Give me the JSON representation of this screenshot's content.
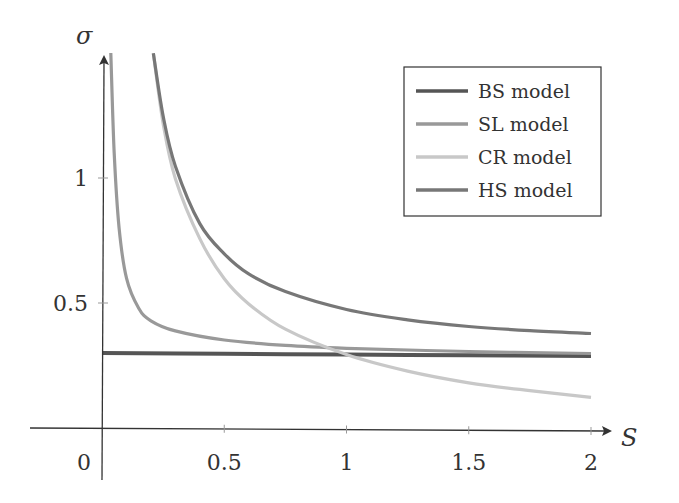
{
  "chart_data": {
    "type": "line",
    "title": "",
    "xlabel": "S",
    "ylabel": "σ",
    "xlim": [
      -0.3,
      2.1
    ],
    "ylim": [
      0,
      1.5
    ],
    "grid": false,
    "legend_position": "upper right",
    "x_ticks": [
      "0",
      "0.5",
      "1",
      "1.5",
      "2"
    ],
    "y_ticks": [
      "0.5",
      "1"
    ],
    "series": [
      {
        "name": "BS model",
        "color": "#555555",
        "x": [
          0.0,
          0.5,
          1.0,
          1.5,
          2.0
        ],
        "y": [
          0.3,
          0.3,
          0.3,
          0.3,
          0.3
        ]
      },
      {
        "name": "SL model",
        "color": "#999999",
        "x": [
          0.036,
          0.05,
          0.07,
          0.1,
          0.15,
          0.2,
          0.3,
          0.5,
          0.75,
          1.0,
          1.5,
          2.0
        ],
        "y": [
          1.5,
          1.1,
          0.8,
          0.6,
          0.48,
          0.43,
          0.39,
          0.355,
          0.335,
          0.325,
          0.315,
          0.31
        ]
      },
      {
        "name": "CR model",
        "color": "#c8c8c8",
        "x": [
          0.21,
          0.25,
          0.3,
          0.4,
          0.5,
          0.6,
          0.75,
          1.0,
          1.25,
          1.5,
          1.75,
          2.0
        ],
        "y": [
          1.5,
          1.22,
          1.0,
          0.76,
          0.6,
          0.5,
          0.4,
          0.3,
          0.235,
          0.19,
          0.16,
          0.135
        ]
      },
      {
        "name": "HS model",
        "color": "#777777",
        "x": [
          0.21,
          0.25,
          0.3,
          0.4,
          0.5,
          0.6,
          0.75,
          1.0,
          1.25,
          1.5,
          1.75,
          2.0
        ],
        "y": [
          1.5,
          1.25,
          1.05,
          0.82,
          0.7,
          0.62,
          0.55,
          0.48,
          0.44,
          0.415,
          0.4,
          0.39
        ]
      }
    ]
  }
}
